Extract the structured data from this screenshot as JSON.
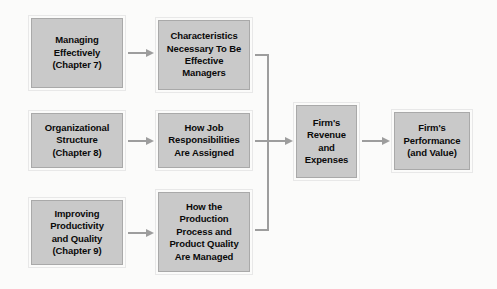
{
  "diagram": {
    "background_color": "#fbfbfa",
    "box_fill_color": "#c9c9c9",
    "connector_color": "#9d9d9d",
    "boxes": [
      {
        "id": "managing-effectively",
        "label": "Managing\nEffectively\n(Chapter 7)"
      },
      {
        "id": "organizational-structure",
        "label": "Organizational\nStructure\n(Chapter 8)"
      },
      {
        "id": "improving-productivity",
        "label": "Improving\nProductivity\nand Quality\n(Chapter 9)"
      },
      {
        "id": "characteristics-effective-managers",
        "label": "Characteristics\nNecessary To Be\nEffective\nManagers"
      },
      {
        "id": "how-job-responsibilities",
        "label": "How Job\nResponsibilities\nAre Assigned"
      },
      {
        "id": "how-production-process",
        "label": "How the\nProduction\nProcess and\nProduct Quality\nAre Managed"
      },
      {
        "id": "firms-revenue-expenses",
        "label": "Firm's\nRevenue\nand\nExpenses"
      },
      {
        "id": "firms-performance",
        "label": "Firm's\nPerformance\n(and Value)"
      }
    ]
  }
}
